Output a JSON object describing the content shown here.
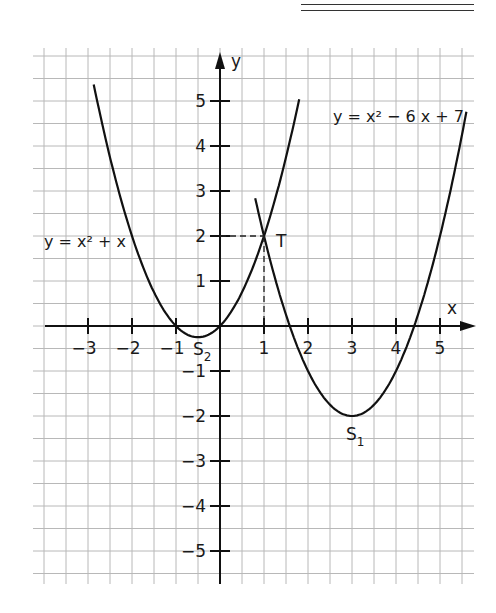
{
  "chart_data": {
    "type": "line",
    "title": "",
    "xlabel": "x",
    "ylabel": "y",
    "xlim": [
      -4.3,
      5.7
    ],
    "ylim": [
      -5.7,
      6
    ],
    "grid": true,
    "x_ticks": [
      -3,
      -2,
      -1,
      1,
      2,
      3,
      4,
      5
    ],
    "y_ticks": [
      -5,
      -4,
      -3,
      -2,
      -1,
      1,
      2,
      3,
      4,
      5
    ],
    "x_tick_labels": [
      "−3",
      "−2",
      "−1",
      "1",
      "2",
      "3",
      "4",
      "5"
    ],
    "y_tick_labels": [
      "−5",
      "−4",
      "−3",
      "−2",
      "−1",
      "1",
      "2",
      "3",
      "4",
      "5"
    ],
    "series": [
      {
        "name": "y = x² + x",
        "formula": "x^2 + x",
        "x": [
          -2.87,
          -2,
          -1,
          -0.5,
          0,
          1,
          1.8
        ],
        "y": [
          5.37,
          2,
          0,
          -0.25,
          0,
          2,
          5.04
        ]
      },
      {
        "name": "y = x² − 6x + 7",
        "formula": "x^2 - 6x + 7",
        "x": [
          0.8,
          1,
          2,
          3,
          4,
          5,
          5.6
        ],
        "y": [
          5.84,
          2,
          -1,
          -2,
          -1,
          2,
          4.96
        ]
      }
    ],
    "annotations": [
      {
        "text": "S₁",
        "x": 3,
        "y": -2,
        "desc": "vertex of y = x² − 6x + 7"
      },
      {
        "text": "S₂",
        "x": -0.5,
        "y": -0.25,
        "desc": "vertex of y = x² + x"
      },
      {
        "text": "T",
        "x": 1,
        "y": 2,
        "desc": "intersection point, dashed guides to axes"
      }
    ]
  },
  "labels": {
    "x_axis": "x",
    "y_axis": "y",
    "eq1": "y = x² + x",
    "eq2": "y = x² − 6 x + 7",
    "s1": "S",
    "s1_sub": "1",
    "s2": "S",
    "s2_sub": "2",
    "t": "T"
  }
}
